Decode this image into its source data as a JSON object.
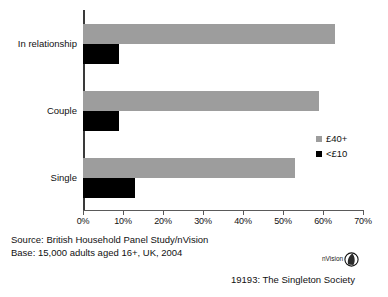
{
  "chart_data": {
    "type": "bar",
    "orientation": "horizontal",
    "title": "",
    "subtitle": "",
    "xlabel": "",
    "ylabel": "",
    "categories": [
      "In relationship",
      "Couple",
      "Single"
    ],
    "series": [
      {
        "name": "£40+",
        "color": "#9d9d9d",
        "values": [
          63,
          59,
          53
        ]
      },
      {
        "name": "<£10",
        "color": "#000000",
        "values": [
          9,
          9,
          13
        ]
      }
    ],
    "xlim": [
      0,
      70
    ],
    "x_ticks": [
      0,
      10,
      20,
      30,
      40,
      50,
      60,
      70
    ],
    "x_tick_labels": [
      "0%",
      "10%",
      "20%",
      "30%",
      "40%",
      "50%",
      "60%",
      "70%"
    ],
    "grid": false,
    "legend_position": "right"
  },
  "legend": {
    "items": [
      {
        "label": "£40+",
        "swatch": "series-high"
      },
      {
        "label": "<£10",
        "swatch": "series-low"
      }
    ]
  },
  "footer": {
    "source": "Source: British Household Panel Study/nVision",
    "base": "Base: 15,000 adults aged 16+, UK, 2004"
  },
  "caption": "19193: The Singleton Society",
  "logo": {
    "text": "nVision",
    "mark": "nvision-eye-icon"
  }
}
